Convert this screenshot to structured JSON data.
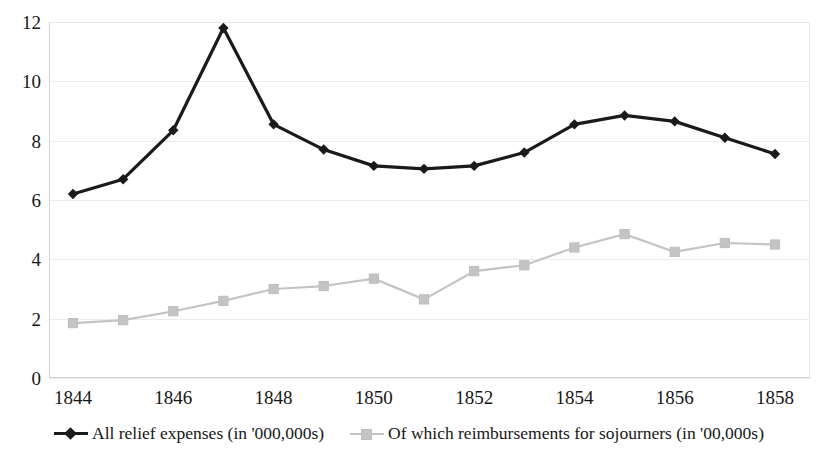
{
  "chart_data": {
    "type": "line",
    "title": "",
    "subtitle": "",
    "xlabel": "",
    "ylabel": "",
    "x": [
      1844,
      1845,
      1846,
      1847,
      1848,
      1849,
      1850,
      1851,
      1852,
      1853,
      1854,
      1855,
      1856,
      1857,
      1858
    ],
    "categories": [
      "1844",
      "1845",
      "1846",
      "1847",
      "1848",
      "1849",
      "1850",
      "1851",
      "1852",
      "1853",
      "1854",
      "1855",
      "1856",
      "1857",
      "1858"
    ],
    "series": [
      {
        "name": "All relief expenses (in '000,000s)",
        "color": "#1a1a1a",
        "marker": "diamond",
        "values": [
          6.2,
          6.7,
          8.35,
          11.8,
          8.55,
          7.7,
          7.15,
          7.05,
          7.15,
          7.6,
          8.55,
          8.85,
          8.65,
          8.1,
          7.55
        ]
      },
      {
        "name": "Of which reimbursements for sojourners (in '00,000s)",
        "color": "#c4c4c4",
        "marker": "square",
        "values": [
          1.85,
          1.95,
          2.25,
          2.6,
          3.0,
          3.1,
          3.35,
          2.65,
          3.6,
          3.8,
          4.4,
          4.85,
          4.25,
          4.55,
          4.5
        ]
      }
    ],
    "ylim": [
      0,
      12
    ],
    "xlim": [
      1844,
      1858
    ],
    "y_ticks": [
      "0",
      "2",
      "4",
      "6",
      "8",
      "10",
      "12"
    ],
    "y_tick_values": [
      0,
      2,
      4,
      6,
      8,
      10,
      12
    ],
    "x_ticks": [
      "1844",
      "1846",
      "1848",
      "1850",
      "1852",
      "1854",
      "1856",
      "1858"
    ],
    "x_tick_values": [
      1844,
      1846,
      1848,
      1850,
      1852,
      1854,
      1856,
      1858
    ],
    "grid": "horizontal",
    "legend_position": "bottom"
  },
  "legend": {
    "entries": [
      {
        "label": "All relief expenses (in '000,000s)",
        "swatch": "black-diamond-line"
      },
      {
        "label": "Of which reimbursements for sojourners (in '00,000s)",
        "swatch": "gray-square-line"
      }
    ]
  }
}
